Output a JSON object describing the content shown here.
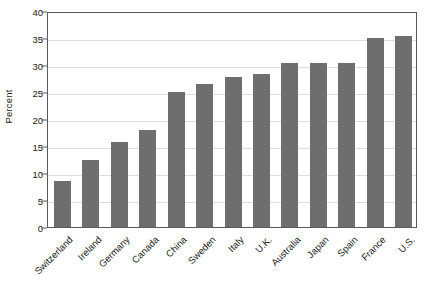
{
  "chart_data": {
    "type": "bar",
    "title": "",
    "subtitle": "",
    "xlabel": "",
    "ylabel": "Percent",
    "ylim": [
      0,
      40
    ],
    "ytick_labels": [
      "0",
      "5",
      "10",
      "15",
      "20",
      "25",
      "30",
      "35",
      "40"
    ],
    "ytick_values": [
      0,
      5,
      10,
      15,
      20,
      25,
      30,
      35,
      40
    ],
    "grid": true,
    "legend": false,
    "legend_position": "none",
    "orientation": "vertical",
    "bar_color": "#6e6e6e",
    "categories": [
      "Switzerland",
      "Ireland",
      "Germany",
      "Canada",
      "China",
      "Sweden",
      "Italy",
      "U.K.",
      "Australia",
      "Japan",
      "Spain",
      "France",
      "U.S."
    ],
    "values": [
      8.5,
      12.5,
      15.8,
      18.0,
      25.0,
      26.5,
      27.7,
      28.3,
      30.3,
      30.3,
      30.3,
      35.0,
      35.4
    ]
  },
  "style": {
    "axis_color": "#5a5a5a",
    "grid_color": "#dedede",
    "text_color": "#1a1a1a",
    "background": "#ffffff"
  }
}
